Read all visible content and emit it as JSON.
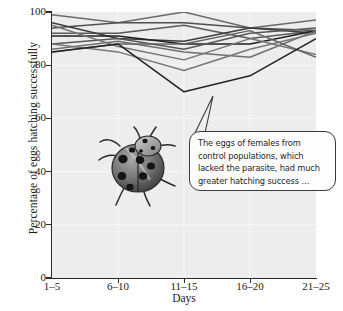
{
  "chart_data": {
    "type": "line",
    "title": "",
    "xlabel": "Days",
    "ylabel": "Percentage of eggs hatching successfully",
    "categories": [
      "1–5",
      "6–10",
      "11–15",
      "16–20",
      "21–25"
    ],
    "ylim": [
      0,
      100
    ],
    "yticks": [
      0,
      20,
      40,
      60,
      80,
      100
    ],
    "ytick_labels": [
      "0",
      "20",
      "40",
      "60",
      "80",
      "100"
    ],
    "grid": true,
    "legend": "none",
    "series": [
      {
        "name": "population-1",
        "values": [
          99,
          96,
          100,
          94,
          97
        ],
        "color": "#6b6b6b"
      },
      {
        "name": "population-2",
        "values": [
          94,
          96,
          96,
          94,
          93
        ],
        "color": "#4f4f4f"
      },
      {
        "name": "population-3",
        "values": [
          92,
          92,
          95,
          90,
          93
        ],
        "color": "#5a5a5a"
      },
      {
        "name": "population-4",
        "values": [
          96,
          90,
          89,
          94,
          92
        ],
        "color": "#3d3d3d"
      },
      {
        "name": "population-5",
        "values": [
          91,
          91,
          88,
          88,
          93
        ],
        "color": "#1f1f1f"
      },
      {
        "name": "population-6",
        "values": [
          88,
          90,
          86,
          92,
          94
        ],
        "color": "#565656"
      },
      {
        "name": "population-7",
        "values": [
          86,
          89,
          85,
          83,
          93
        ],
        "color": "#6f6f6f"
      },
      {
        "name": "population-8",
        "values": [
          95,
          87,
          82,
          90,
          84
        ],
        "color": "#747474"
      },
      {
        "name": "population-9",
        "values": [
          88,
          85,
          78,
          86,
          92
        ],
        "color": "#787878"
      },
      {
        "name": "population-10",
        "values": [
          85,
          88,
          88,
          93,
          83
        ],
        "color": "#636363"
      },
      {
        "name": "population-11",
        "values": [
          85,
          88,
          70,
          76,
          90
        ],
        "color": "#232323"
      }
    ],
    "annotation": {
      "lines": [
        "The eggs of females from",
        "control populations, which",
        "lacked the parasite, had much",
        "greater hatching success …"
      ],
      "pointer_target": {
        "x": "11–15",
        "y": 70
      }
    },
    "illustration": {
      "name": "ladybug-beetle",
      "body_color": "#6e6e6e",
      "spot_color": "#161616"
    },
    "plot_background": "#ededed",
    "axis_color": "#2b2b2b"
  }
}
